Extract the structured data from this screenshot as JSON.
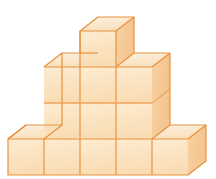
{
  "image": {
    "title": "Empilhamento de cubos em perspectiva isométrica",
    "credit": "Ilustrações: Banco de imagens/Arquivo da editora",
    "background_color": "#ffffff"
  },
  "palette": {
    "top_face": "#fbe3c4",
    "top_face_light": "#fdf0dc",
    "front_face": "#fbdcb6",
    "front_face_light": "#fdeacc",
    "side_face": "#f7cfa0",
    "side_face_light": "#fadfbb",
    "edge": "#e8913c",
    "edge_soft": "#eba css",
    "outline": "#e08a33"
  },
  "structure": {
    "type": "stacked-cubes",
    "description": "Pilha de cubos em forma de escada/pirâmide",
    "bottom_row_count": 5,
    "middle_block_columns": 3,
    "middle_block_rows": 2,
    "top_row_count": 1,
    "total_visible_cubes": 12,
    "rows": [
      {
        "label": "topo",
        "cubes": 1
      },
      {
        "label": "terceira fileira",
        "cubes": 3
      },
      {
        "label": "segunda fileira",
        "cubes": 3
      },
      {
        "label": "base",
        "cubes": 5
      }
    ]
  },
  "geometry": {
    "cube_width": 36,
    "cube_height": 36,
    "depth_x": 18,
    "depth_y": -14,
    "origin_x": 8,
    "baseline_y": 175
  }
}
